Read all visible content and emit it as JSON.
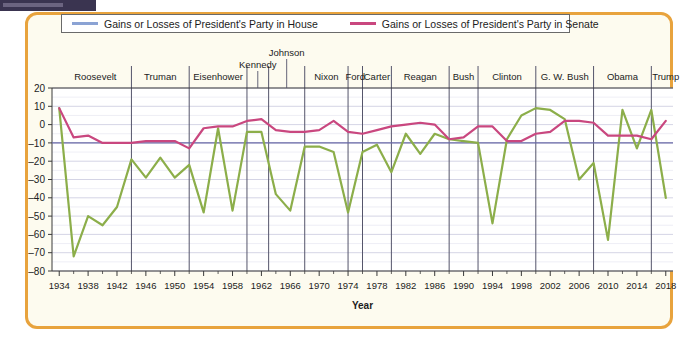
{
  "window": {
    "topbar_present": true
  },
  "legend": {
    "house": {
      "label": "Gains or Losses of President's Party in House",
      "color": "#8ba3d4",
      "icon": "line-swatch"
    },
    "senate": {
      "label": "Gains or Losses of President's Party in Senate",
      "color": "#c9477f",
      "icon": "line-swatch"
    }
  },
  "axes": {
    "x_title": "Year",
    "y_ticks": [
      20,
      10,
      0,
      -10,
      -20,
      -30,
      -40,
      -50,
      -60,
      -70,
      -80
    ],
    "x_ticks": [
      1934,
      1938,
      1942,
      1946,
      1950,
      1954,
      1958,
      1962,
      1966,
      1970,
      1974,
      1978,
      1982,
      1986,
      1990,
      1994,
      1998,
      2002,
      2006,
      2010,
      2014,
      2018
    ]
  },
  "presidents": [
    {
      "name": "Roosevelt",
      "start": 1934,
      "end": 1944
    },
    {
      "name": "Truman",
      "start": 1944,
      "end": 1952
    },
    {
      "name": "Eisenhower",
      "start": 1952,
      "end": 1960
    },
    {
      "name": "Kennedy",
      "start": 1960,
      "end": 1963
    },
    {
      "name": "Johnson",
      "start": 1963,
      "end": 1968
    },
    {
      "name": "Nixon",
      "start": 1968,
      "end": 1974
    },
    {
      "name": "Ford",
      "start": 1974,
      "end": 1976
    },
    {
      "name": "Carter",
      "start": 1976,
      "end": 1980
    },
    {
      "name": "Reagan",
      "start": 1980,
      "end": 1988
    },
    {
      "name": "Bush",
      "start": 1988,
      "end": 1992
    },
    {
      "name": "Clinton",
      "start": 1992,
      "end": 2000
    },
    {
      "name": "G. W. Bush",
      "start": 2000,
      "end": 2008
    },
    {
      "name": "Obama",
      "start": 2008,
      "end": 2016
    },
    {
      "name": "Trump",
      "start": 2016,
      "end": 2020
    }
  ],
  "chart_data": {
    "type": "line",
    "title": "",
    "xlabel": "Year",
    "ylabel": "",
    "xlim": [
      1933,
      2019
    ],
    "ylim": [
      -80,
      20
    ],
    "grid": true,
    "legend_position": "top",
    "x": [
      1934,
      1936,
      1938,
      1940,
      1942,
      1944,
      1946,
      1948,
      1950,
      1952,
      1954,
      1956,
      1958,
      1960,
      1962,
      1964,
      1966,
      1968,
      1970,
      1972,
      1974,
      1976,
      1978,
      1980,
      1982,
      1984,
      1986,
      1988,
      1990,
      1992,
      1994,
      1996,
      1998,
      2000,
      2002,
      2004,
      2006,
      2008,
      2010,
      2012,
      2014,
      2016,
      2018
    ],
    "series": [
      {
        "name": "Gains or Losses of President's Party in House",
        "color": "#8cae4a",
        "values": [
          9,
          -72,
          -50,
          -55,
          -45,
          -19,
          -29,
          -18,
          -29,
          -22,
          -48,
          -2,
          -47,
          -4,
          -4,
          -38,
          -47,
          -12,
          -12,
          -15,
          -48,
          -15,
          -11,
          -26,
          -5,
          -16,
          -5,
          -8,
          -9,
          -10,
          -54,
          -8,
          5,
          9,
          8,
          3,
          -30,
          -21,
          -63,
          8,
          -13,
          8,
          -40
        ]
      },
      {
        "name": "Gains or Losses of President's Party in Senate",
        "color": "#c9477f",
        "values": [
          9,
          -7,
          -6,
          -10,
          -10,
          -10,
          -9,
          -9,
          -9,
          -13,
          -2,
          -1,
          -1,
          2,
          3,
          -3,
          -4,
          -4,
          -3,
          2,
          -4,
          -5,
          -3,
          -1,
          0,
          1,
          0,
          -8,
          -7,
          -1,
          -1,
          -9,
          -9,
          -5,
          -4,
          2,
          2,
          1,
          -6,
          -6,
          -6,
          -8,
          2
        ]
      }
    ],
    "reference_line": {
      "value": -10,
      "color": "#6a6aa8",
      "label": ""
    }
  }
}
